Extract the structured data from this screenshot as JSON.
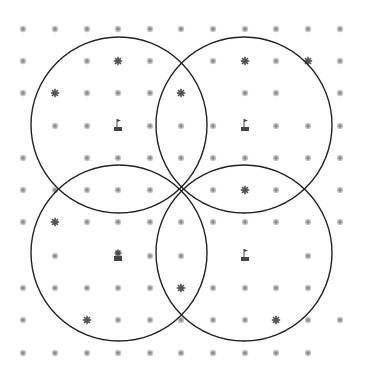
{
  "diagram": {
    "type": "coverage-circles-on-grid",
    "colors": {
      "background": "#ffffff",
      "dot": "#8a8a8a",
      "dot_ring": "#c8c8c8",
      "star": "#555555",
      "circle": "#222222",
      "flag": "#444444"
    },
    "grid": {
      "x": [
        23,
        55,
        87,
        118,
        150,
        181,
        213,
        245,
        276,
        308,
        340
      ],
      "y": [
        29,
        61,
        93,
        126,
        158,
        190,
        222,
        256,
        288,
        320,
        353
      ],
      "rows": [
        "ooooooooooo",
        "o.oso.ososo",
        "osooos.oo.o",
        ".ooFoooFooo",
        "o.ooooooooo",
        "ooooo.oso.o",
        "osooooooooo",
        ".o.Xoo.F.o.",
        "ooooosoooo o",
        "o.sooooosoo",
        "oooooooooo."
      ],
      "legend": {
        "o": "sensor-node",
        "s": "star-node",
        "F": "flag-base-station",
        "X": "flag-with-star",
        ".": "empty"
      }
    },
    "circles": [
      {
        "name": "top-left",
        "cx": 119,
        "cy": 125,
        "r": 88
      },
      {
        "name": "top-right",
        "cx": 244,
        "cy": 125,
        "r": 88
      },
      {
        "name": "bottom-left",
        "cx": 119,
        "cy": 253,
        "r": 88
      },
      {
        "name": "bottom-right",
        "cx": 244,
        "cy": 253,
        "r": 88
      }
    ]
  }
}
